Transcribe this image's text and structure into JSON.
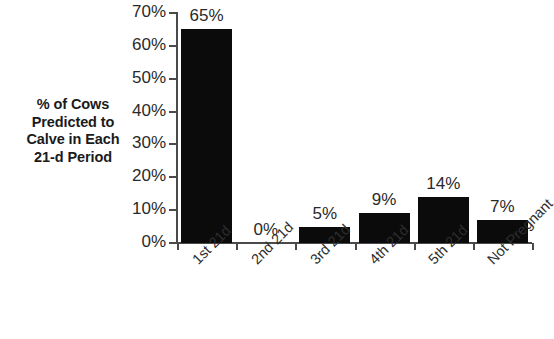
{
  "chart_data": {
    "type": "bar",
    "title": "",
    "subtitle": "",
    "xlabel": "",
    "ylabel": "% of Cows Predicted to Calve in Each 21-d Period",
    "ylabel_lines": [
      "% of Cows",
      "Predicted to",
      "Calve in Each",
      "21-d Period"
    ],
    "categories": [
      "1st 21d",
      "2nd 21d",
      "3rd 21d",
      "4th 21d",
      "5th 21d",
      "Not Pregnant"
    ],
    "values": [
      65,
      0,
      5,
      9,
      14,
      7
    ],
    "data_labels": [
      "65%",
      "0%",
      "5%",
      "9%",
      "14%",
      "7%"
    ],
    "ylim": [
      0,
      70
    ],
    "ytick_values": [
      0,
      10,
      20,
      30,
      40,
      50,
      60,
      70
    ],
    "ytick_labels": [
      "0%",
      "10%",
      "20%",
      "30%",
      "40%",
      "50%",
      "60%",
      "70%"
    ],
    "grid": false,
    "legend": null,
    "bar_color": "#0b0b0b",
    "axis_color": "#4a4a4a",
    "background": "#ffffff",
    "xtick_label_rotation": -45
  }
}
